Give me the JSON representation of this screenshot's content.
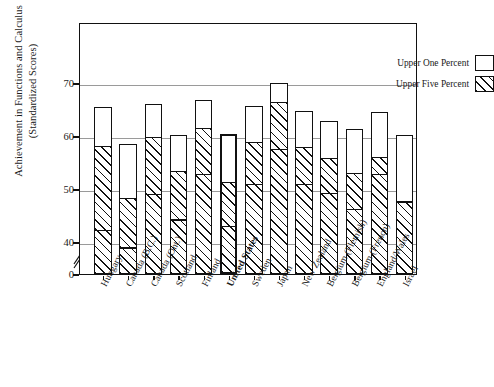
{
  "chart_data": {
    "type": "bar",
    "subtype": "stacked-bar",
    "title": "",
    "xlabel": "",
    "ylabel": "Achievement in Functions and Calculus (Standardized Scores)",
    "ylabel_line1": "Achievement in Functions and Calculus",
    "ylabel_line2": "(Standardized Scores)",
    "ylim": [
      0,
      74
    ],
    "yticks": [
      0,
      40,
      50,
      60,
      70
    ],
    "ytick_labels": [
      "0",
      "40",
      "50",
      "60",
      "70"
    ],
    "axis_break": true,
    "axis_break_between": [
      0,
      40
    ],
    "grid": true,
    "gridlines_at": [
      40,
      50,
      60,
      70
    ],
    "legend": {
      "position": "top-right-inside",
      "entries": [
        {
          "label": "Upper One Percent",
          "pattern": "empty-box"
        },
        {
          "label": "Upper Five Percent",
          "pattern": "diagonal-hatch"
        }
      ]
    },
    "categories": [
      "Hungary",
      "Canada (B.C.)",
      "Canada (Ont.)",
      "Scotland",
      "Finland",
      "United States",
      "Sweden",
      "Japan",
      "New Zealand",
      "Belgium (Flemish)",
      "Belgium (French)",
      "England/Wales",
      "Israel"
    ],
    "highlighted_category": "United States",
    "series": [
      {
        "name": "Upper One Percent",
        "values": [
          65.5,
          58.5,
          66.0,
          60.2,
          66.8,
          60.3,
          65.6,
          70.0,
          64.8,
          62.8,
          61.3,
          64.5,
          60.2
        ]
      },
      {
        "name": "Upper Five Percent",
        "values": [
          58.0,
          48.2,
          59.6,
          53.2,
          61.3,
          51.0,
          58.6,
          66.3,
          57.8,
          55.6,
          52.8,
          55.9,
          47.5
        ]
      }
    ],
    "inner_reference_marks": [
      42.5,
      39.2,
      49.3,
      44.5,
      53.0,
      43.4,
      51.2,
      57.8,
      51.2,
      49.5,
      46.5,
      53.1,
      47.8
    ]
  },
  "colors": {
    "frame": "#111111",
    "gridline": "#9a9a9a",
    "bar_fill": "#ffffff",
    "hatch": "#111111",
    "text": "#1a1a1a"
  }
}
